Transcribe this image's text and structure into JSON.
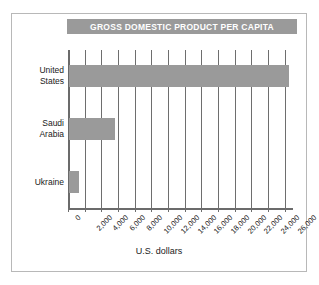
{
  "chart_data": {
    "type": "bar",
    "orientation": "horizontal",
    "title": "GROSS DOMESTIC PRODUCT PER CAPITA",
    "xlabel": "U.S. dollars",
    "ylabel": "",
    "categories": [
      "United States",
      "Saudi Arabia",
      "Ukraine"
    ],
    "values": [
      26400,
      5500,
      1200
    ],
    "xlim": [
      0,
      27000
    ],
    "xticks": [
      0,
      2000,
      4000,
      6000,
      8000,
      10000,
      12000,
      14000,
      16000,
      18000,
      20000,
      22000,
      24000,
      26000
    ],
    "xticklabels": [
      "0",
      "2,000",
      "4,000",
      "6,000",
      "8,000",
      "10,000",
      "12,000",
      "14,000",
      "16,000",
      "18,000",
      "20,000",
      "22,000",
      "24,000",
      "26,000"
    ],
    "grid": "vertical",
    "legend": null,
    "bar_color": "#9a9a9a",
    "title_banner_color": "#9a9a9a",
    "title_text_color": "#ffffff",
    "axis_color": "#6e6e6e",
    "border_color": "#b8b8b8"
  }
}
